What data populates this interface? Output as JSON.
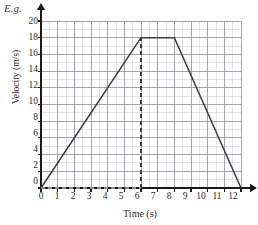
{
  "annotation": {
    "eg_label": "E.g."
  },
  "chart_data": {
    "type": "line",
    "title": "",
    "subtitle": "",
    "xlabel": "Time (s)",
    "ylabel": "Velocity (m/s)",
    "xlim": [
      0,
      12
    ],
    "ylim": [
      0,
      20
    ],
    "x_major_step": 1,
    "y_major_step": 2,
    "x_minor_divisions": 2,
    "y_minor_divisions": 2,
    "grid": true,
    "legend": "none",
    "xticks": [
      "0",
      "1",
      "2",
      "3",
      "4",
      "5",
      "6",
      "7",
      "8",
      "9",
      "10",
      "11",
      "12"
    ],
    "yticks": [
      "0",
      "2",
      "4",
      "6",
      "8",
      "10",
      "12",
      "14",
      "16",
      "18",
      "20"
    ],
    "series": [
      {
        "name": "velocity",
        "style": "solid",
        "color": "#3a3a3a",
        "x": [
          0,
          6,
          8,
          12
        ],
        "values": [
          0,
          18,
          18,
          0
        ]
      }
    ],
    "annotations": [
      {
        "name": "dashed-vertical-at-6",
        "style": "dashed",
        "x": 6,
        "y_from": 0,
        "y_to": 18,
        "color": "#3a3a3a"
      },
      {
        "name": "dashed-horizontal-baseline",
        "style": "dashed",
        "y": 0,
        "x_from": 0,
        "x_to": 6,
        "color": "#8a8a8a"
      }
    ],
    "axis_arrows": {
      "x": true,
      "y": true
    },
    "colors": {
      "major_grid": "#9a9aa5",
      "minor_grid": "#cfcfd8",
      "axis": "#1a1a1a",
      "line": "#3a3a3a"
    }
  }
}
